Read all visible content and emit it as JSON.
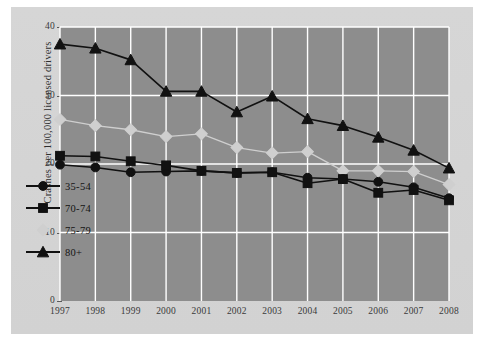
{
  "chart_data": {
    "type": "line",
    "title": "",
    "subtitle": "",
    "xlabel": "",
    "ylabel": "Crashes per 100,000 licensed drivers",
    "categories": [
      "1997",
      "1998",
      "1999",
      "2000",
      "2001",
      "2002",
      "2003",
      "2004",
      "2005",
      "2006",
      "2007",
      "2008"
    ],
    "x": [
      1997,
      1998,
      1999,
      2000,
      2001,
      2002,
      2003,
      2004,
      2005,
      2006,
      2007,
      2008
    ],
    "xlim": [
      1997,
      2008
    ],
    "ylim": [
      0,
      40
    ],
    "yticks": [
      0,
      10,
      20,
      30,
      40
    ],
    "ytick_labels": [
      "0",
      "10",
      "20",
      "30",
      "40"
    ],
    "grid": true,
    "grid_color": "#ffffff",
    "plot_background": "#8d8d8d",
    "figure_background": "#d4d4d4",
    "legend_position": "inside-lower-left",
    "series": [
      {
        "name": "35-54",
        "marker": "circle",
        "color": "#111111",
        "values": [
          19.9,
          19.5,
          18.8,
          18.9,
          19.0,
          18.7,
          18.8,
          18.0,
          17.8,
          17.4,
          16.6,
          15.0
        ]
      },
      {
        "name": "70-74",
        "marker": "square",
        "color": "#111111",
        "values": [
          21.2,
          21.1,
          20.4,
          19.8,
          19.0,
          18.7,
          18.8,
          17.2,
          17.8,
          15.8,
          16.2,
          14.7
        ]
      },
      {
        "name": "75-79",
        "marker": "diamond",
        "color": "#cfcfcf",
        "values": [
          26.5,
          25.6,
          25.0,
          24.0,
          24.4,
          22.4,
          21.6,
          21.8,
          19.0,
          19.0,
          18.9,
          17.0
        ]
      },
      {
        "name": "80+",
        "marker": "triangle",
        "color": "#111111",
        "values": [
          37.5,
          36.9,
          35.2,
          30.6,
          30.6,
          27.6,
          29.9,
          26.6,
          25.6,
          23.9,
          22.0,
          19.4
        ]
      }
    ]
  },
  "legend": {
    "items": [
      {
        "label": "35-54",
        "marker": "circle-marker"
      },
      {
        "label": "70-74",
        "marker": "square-marker"
      },
      {
        "label": "75-79",
        "marker": "diamond-marker"
      },
      {
        "label": "80+",
        "marker": "triangle-marker"
      }
    ]
  }
}
